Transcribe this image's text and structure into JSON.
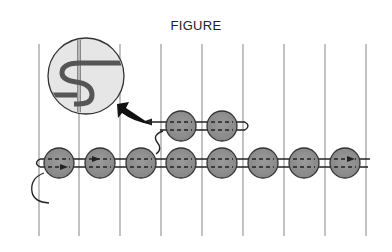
{
  "figure": {
    "title": "FIGURE",
    "colors": {
      "background": "#ffffff",
      "grid_line": "#9a9a9a",
      "bead_fill": "#8c8c8c",
      "bead_stroke": "#333333",
      "thread": "#222222",
      "inset_fill": "#e6e6e6",
      "inset_warp": "#888888"
    },
    "warp_lines": {
      "count": 9,
      "x": [
        39,
        79,
        120,
        161,
        202,
        243,
        284,
        325,
        366
      ],
      "y_top": 44,
      "y_bottom": 236
    },
    "bottom_row_beads": {
      "count": 8,
      "cx": [
        59,
        100,
        141,
        181,
        222,
        263,
        304,
        345
      ],
      "cy": 163,
      "r": 15
    },
    "top_row_beads": {
      "count": 2,
      "cx": [
        181,
        222
      ],
      "cy": 126,
      "r": 15
    },
    "inset": {
      "description": "magnified view of thread weaving around warp",
      "cx": 86,
      "cy": 76,
      "r": 38
    },
    "arrows": [
      "thread direction arrows",
      "pointer arrow from inset to beads"
    ]
  }
}
